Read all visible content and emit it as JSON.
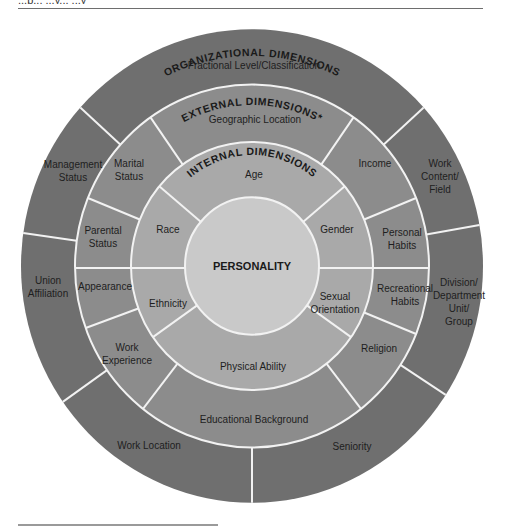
{
  "page": {
    "header_partial_text": "...p... ...y... ...y"
  },
  "diagram": {
    "colors": {
      "organizational_ring": "#6f6f6f",
      "external_ring": "#8c8c8c",
      "internal_ring": "#a9a9a9",
      "core": "#c9c9c9",
      "divider": "#f2f2f2"
    },
    "core": {
      "label": "PERSONALITY"
    },
    "internal": {
      "heading": "INTERNAL DIMENSIONS",
      "segments": [
        {
          "label": "Age"
        },
        {
          "label": "Gender"
        },
        {
          "label_line1": "Sexual",
          "label_line2": "Orientation"
        },
        {
          "label": "Physical Ability"
        },
        {
          "label": "Ethnicity"
        },
        {
          "label": "Race"
        }
      ]
    },
    "external": {
      "heading": "EXTERNAL DIMENSIONS*",
      "segments": [
        {
          "label": "Geographic Location"
        },
        {
          "label": "Income"
        },
        {
          "label_line1": "Personal",
          "label_line2": "Habits"
        },
        {
          "label_line1": "Recreational",
          "label_line2": "Habits"
        },
        {
          "label": "Religion"
        },
        {
          "label": "Educational Background"
        },
        {
          "label_line1": "Work",
          "label_line2": "Experience"
        },
        {
          "label": "Appearance"
        },
        {
          "label_line1": "Parental",
          "label_line2": "Status"
        },
        {
          "label_line1": "Marital",
          "label_line2": "Status"
        }
      ]
    },
    "organizational": {
      "heading": "ORGANIZATIONAL DIMENSIONS",
      "segments": [
        {
          "label": "Fractional Level/Classification"
        },
        {
          "label_line1": "Work",
          "label_line2": "Content/",
          "label_line3": "Field"
        },
        {
          "label_line1": "Division/",
          "label_line2": "Department",
          "label_line3": "Unit/",
          "label_line4": "Group"
        },
        {
          "label": "Seniority"
        },
        {
          "label": "Work Location"
        },
        {
          "label_line1": "Union",
          "label_line2": "Affiliation"
        },
        {
          "label_line1": "Management",
          "label_line2": "Status"
        }
      ]
    }
  }
}
